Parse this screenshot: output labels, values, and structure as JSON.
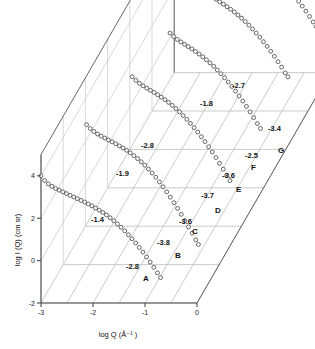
{
  "figure": {
    "kind": "3d-waterfall-scatter",
    "background": "#ffffff"
  },
  "axes": {
    "x": {
      "label": "log Q (Å⁻¹ )",
      "label_plain": "log Q (A^-1)",
      "ticks": [
        "-3",
        "-2",
        "-1",
        "0"
      ],
      "range": [
        -3,
        0
      ]
    },
    "y": {
      "label": "log I (Q) (cm sr)",
      "ticks": [
        "4",
        "2",
        "0",
        "-2"
      ],
      "range": [
        -2,
        5
      ]
    },
    "z": {
      "label": "",
      "ticks": []
    }
  },
  "chart_data": {
    "type": "scatter",
    "title": "",
    "subtitle": "",
    "xlabel": "log Q (Å⁻¹ )",
    "ylabel": "log I (Q) (cm sr)",
    "xlim": [
      -3,
      0
    ],
    "ylim": [
      -2,
      5
    ],
    "grid": true,
    "legend": "none",
    "projection": "3d-offset-waterfall",
    "marker": "open-circle",
    "series": [
      {
        "name": "A",
        "label": "A",
        "depth_index": 0,
        "slope_low_q": "-1.4",
        "slope_high_q": "-2.8",
        "annotations": [
          "-1.4",
          "-2.8"
        ],
        "x": [
          -3.0,
          -2.93,
          -2.86,
          -2.79,
          -2.72,
          -2.65,
          -2.58,
          -2.51,
          -2.44,
          -2.37,
          -2.3,
          -2.23,
          -2.16,
          -2.09,
          -2.02,
          -1.95,
          -1.88,
          -1.81,
          -1.74,
          -1.67,
          -1.6,
          -1.53,
          -1.46,
          -1.39,
          -1.32,
          -1.25,
          -1.18,
          -1.11,
          -1.04,
          -0.97,
          -0.9,
          -0.83,
          -0.76,
          -0.7
        ],
        "y": [
          4.0,
          3.78,
          3.62,
          3.5,
          3.4,
          3.32,
          3.24,
          3.16,
          3.08,
          3.0,
          2.92,
          2.84,
          2.76,
          2.67,
          2.58,
          2.48,
          2.38,
          2.27,
          2.15,
          2.02,
          1.88,
          1.73,
          1.57,
          1.4,
          1.22,
          1.03,
          0.83,
          0.62,
          0.4,
          0.17,
          -0.07,
          -0.32,
          -0.58,
          -0.8
        ]
      },
      {
        "name": "B",
        "label": "B",
        "depth_index": 1,
        "slope_low_q": "-1.9",
        "slope_high_q": "-3.8",
        "annotations": [
          "-1.9",
          "-3.8"
        ],
        "x": [
          -2.55,
          -2.48,
          -2.41,
          -2.34,
          -2.27,
          -2.2,
          -2.13,
          -2.06,
          -1.99,
          -1.92,
          -1.85,
          -1.78,
          -1.71,
          -1.64,
          -1.57,
          -1.5,
          -1.43,
          -1.36,
          -1.29,
          -1.22,
          -1.15,
          -1.08,
          -1.01,
          -0.94,
          -0.87,
          -0.8,
          -0.73,
          -0.66,
          -0.59,
          -0.52,
          -0.45,
          -0.4
        ],
        "y": [
          4.6,
          4.42,
          4.28,
          4.16,
          4.06,
          3.97,
          3.88,
          3.79,
          3.7,
          3.6,
          3.5,
          3.39,
          3.27,
          3.14,
          3.0,
          2.85,
          2.69,
          2.51,
          2.32,
          2.12,
          1.9,
          1.67,
          1.43,
          1.18,
          0.92,
          0.65,
          0.37,
          0.08,
          -0.22,
          -0.52,
          -0.83,
          -1.05
        ]
      },
      {
        "name": "C",
        "label": "C",
        "depth_index": 2,
        "slope_low_q": "-2.8",
        "slope_high_q": "-3.6",
        "annotations": [
          "-2.8",
          "-3.6"
        ],
        "x": [
          -2.1,
          -2.03,
          -1.96,
          -1.89,
          -1.82,
          -1.75,
          -1.68,
          -1.61,
          -1.54,
          -1.47,
          -1.4,
          -1.33,
          -1.26,
          -1.19,
          -1.12,
          -1.05,
          -0.98,
          -0.91,
          -0.84,
          -0.77,
          -0.7,
          -0.63,
          -0.56,
          -0.49,
          -0.42,
          -0.35,
          -0.28,
          -0.22
        ],
        "y": [
          5.05,
          4.88,
          4.74,
          4.62,
          4.51,
          4.41,
          4.31,
          4.2,
          4.09,
          3.97,
          3.84,
          3.7,
          3.55,
          3.39,
          3.22,
          3.04,
          2.85,
          2.65,
          2.44,
          2.22,
          1.99,
          1.75,
          1.5,
          1.24,
          0.97,
          0.69,
          0.4,
          0.15
        ]
      },
      {
        "name": "D",
        "label": "D",
        "depth_index": 3,
        "slope_low_q": "-1.8",
        "slope_high_q": "-3.7",
        "annotations": [
          "-1.8",
          "-3.7"
        ],
        "x": [
          -1.8,
          -1.73,
          -1.66,
          -1.59,
          -1.52,
          -1.45,
          -1.38,
          -1.31,
          -1.24,
          -1.17,
          -1.1,
          -1.03,
          -0.96,
          -0.89,
          -0.82,
          -0.75,
          -0.68,
          -0.61,
          -0.54,
          -0.47,
          -0.4,
          -0.33,
          -0.26,
          -0.19,
          -0.12,
          -0.06
        ],
        "y": [
          5.3,
          5.14,
          5.0,
          4.88,
          4.77,
          4.66,
          4.55,
          4.43,
          4.31,
          4.18,
          4.04,
          3.89,
          3.73,
          3.56,
          3.38,
          3.19,
          2.99,
          2.78,
          2.56,
          2.33,
          2.09,
          1.84,
          1.58,
          1.31,
          1.03,
          0.8
        ]
      },
      {
        "name": "E",
        "label": "E",
        "depth_index": 4,
        "slope_low_q": "-2.8",
        "slope_high_q": "-3.6",
        "annotations": [
          "-2.8",
          "-3.6"
        ],
        "x": [
          -1.55,
          -1.48,
          -1.41,
          -1.34,
          -1.27,
          -1.2,
          -1.13,
          -1.06,
          -0.99,
          -0.92,
          -0.85,
          -0.78,
          -0.71,
          -0.64,
          -0.57,
          -0.5,
          -0.43,
          -0.36,
          -0.29,
          -0.22,
          -0.15,
          -0.08,
          -0.01,
          0.04
        ],
        "y": [
          5.5,
          5.34,
          5.2,
          5.08,
          4.96,
          4.85,
          4.73,
          4.61,
          4.48,
          4.34,
          4.19,
          4.03,
          3.86,
          3.68,
          3.49,
          3.29,
          3.08,
          2.86,
          2.63,
          2.39,
          2.14,
          1.88,
          1.61,
          1.42
        ]
      },
      {
        "name": "F",
        "label": "F",
        "depth_index": 5,
        "slope_low_q": "-1.8",
        "slope_high_q": "-2.5",
        "annotations": [
          "-1.8",
          "-2.5"
        ],
        "x": [
          -1.3,
          -1.23,
          -1.16,
          -1.09,
          -1.02,
          -0.95,
          -0.88,
          -0.81,
          -0.74,
          -0.67,
          -0.6,
          -0.53,
          -0.46,
          -0.39,
          -0.32,
          -0.25,
          -0.18,
          -0.11,
          -0.04,
          0.03,
          0.1,
          0.16
        ],
        "y": [
          5.7,
          5.54,
          5.41,
          5.29,
          5.17,
          5.05,
          4.93,
          4.8,
          4.66,
          4.51,
          4.35,
          4.18,
          4.0,
          3.81,
          3.61,
          3.4,
          3.18,
          2.95,
          2.71,
          2.46,
          2.2,
          1.98
        ]
      },
      {
        "name": "G",
        "label": "G",
        "depth_index": 6,
        "slope_low_q": "-2.7",
        "slope_high_q": "-3.4",
        "annotations": [
          "-2.7",
          "-3.4"
        ],
        "x": [
          -1.05,
          -0.98,
          -0.91,
          -0.84,
          -0.77,
          -0.7,
          -0.63,
          -0.56,
          -0.49,
          -0.42,
          -0.35,
          -0.28,
          -0.21,
          -0.14,
          -0.07,
          0.0,
          0.07,
          0.14,
          0.21,
          0.28
        ],
        "y": [
          5.9,
          5.74,
          5.61,
          5.49,
          5.37,
          5.25,
          5.12,
          4.98,
          4.83,
          4.67,
          4.5,
          4.32,
          4.13,
          3.93,
          3.72,
          3.5,
          3.27,
          3.03,
          2.78,
          2.55
        ]
      }
    ]
  },
  "curve_labels": [
    {
      "text": "A",
      "x": 143,
      "y": 281
    },
    {
      "text": "B",
      "x": 175,
      "y": 258
    },
    {
      "text": "C",
      "x": 192,
      "y": 234
    },
    {
      "text": "D",
      "x": 215,
      "y": 213
    },
    {
      "text": "E",
      "x": 236,
      "y": 192
    },
    {
      "text": "F",
      "x": 251,
      "y": 170
    },
    {
      "text": "G",
      "x": 278,
      "y": 153
    }
  ],
  "slope_labels": [
    {
      "text": "-1.4",
      "x": 91,
      "y": 222
    },
    {
      "text": "-2.8",
      "x": 126,
      "y": 269
    },
    {
      "text": "-1.9",
      "x": 116,
      "y": 176
    },
    {
      "text": "-3.8",
      "x": 157,
      "y": 245
    },
    {
      "text": "-2.8",
      "x": 141,
      "y": 148
    },
    {
      "text": "-3.6",
      "x": 179,
      "y": 224
    },
    {
      "text": "-1.8",
      "x": 200,
      "y": 106
    },
    {
      "text": "-3.7",
      "x": 201,
      "y": 198
    },
    {
      "text": "-3.6",
      "x": 222,
      "y": 178
    },
    {
      "text": "-2.7",
      "x": 232,
      "y": 88
    },
    {
      "text": "-2.5",
      "x": 245,
      "y": 158
    },
    {
      "text": "-3.4",
      "x": 268,
      "y": 131
    }
  ]
}
